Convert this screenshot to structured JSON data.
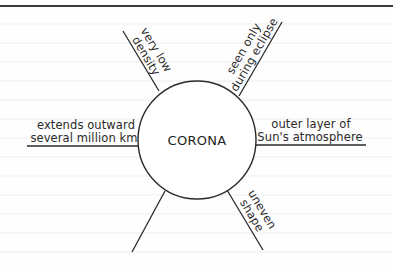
{
  "diagram": {
    "type": "concept-web",
    "center": {
      "label": "CORONA"
    },
    "spokes": [
      {
        "id": "upper-left",
        "lines": [
          "very low",
          "density"
        ]
      },
      {
        "id": "upper-right",
        "lines": [
          "seen only",
          "during eclipse"
        ]
      },
      {
        "id": "left",
        "lines": [
          "extends outward",
          "several million km"
        ]
      },
      {
        "id": "right",
        "lines": [
          "outer layer of",
          "Sun's atmosphere"
        ]
      },
      {
        "id": "lower-right",
        "lines": [
          "uneven",
          "shape"
        ]
      },
      {
        "id": "lower-left",
        "lines": []
      }
    ]
  },
  "colors": {
    "ink": "#2a2a2a",
    "border": "#3a3a3a",
    "ruled_line": "#ececec",
    "background": "#fefefe"
  }
}
